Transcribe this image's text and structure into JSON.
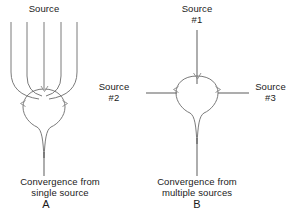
{
  "figure": {
    "background_color": "#ffffff",
    "stroke_color": "#6b6b6b",
    "text_color": "#1a1a1a"
  },
  "panel_a": {
    "letter": "A",
    "source_label": "Source",
    "caption_line1": "Convergence from",
    "caption_line2": "single source",
    "fan_branch_count": 5
  },
  "panel_b": {
    "letter": "B",
    "source_1_line1": "Source",
    "source_1_line2": "#1",
    "source_2_line1": "Source",
    "source_2_line2": "#2",
    "source_3_line1": "Source",
    "source_3_line2": "#3",
    "caption_line1": "Convergence from",
    "caption_line2": "multiple sources"
  }
}
